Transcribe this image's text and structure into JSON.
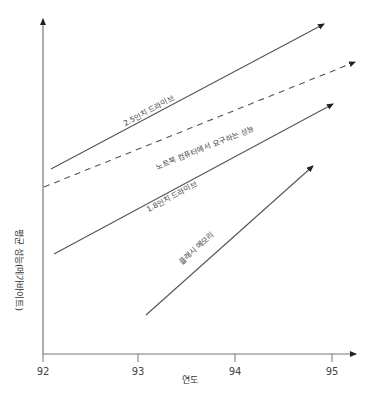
{
  "chart_data": {
    "type": "line",
    "title": "",
    "xlabel": "연도",
    "ylabel": "평균 성능(메가바이트)",
    "x_ticks": [
      "92",
      "93",
      "94",
      "95"
    ],
    "xlim": [
      92,
      95.25
    ],
    "y_ticks": [],
    "grid": false,
    "legend": "inline labels along lines",
    "series": [
      {
        "name": "2.5인치 드라이브",
        "style": "solid",
        "x": [
          92.08,
          95.0
        ],
        "y_rel": [
          0.53,
          0.95
        ]
      },
      {
        "name": "노트북 컴퓨터에서 요구하는 성능",
        "style": "dashed",
        "x": [
          92.0,
          95.25
        ],
        "y_rel": [
          0.49,
          0.87
        ]
      },
      {
        "name": "1.8인치 드라이브",
        "style": "solid",
        "x": [
          92.1,
          95.1
        ],
        "y_rel": [
          0.29,
          0.74
        ]
      },
      {
        "name": "플래시 메모리",
        "style": "solid",
        "x": [
          93.05,
          94.9
        ],
        "y_rel": [
          0.12,
          0.56
        ]
      }
    ]
  },
  "axes": {
    "x_label": "연도",
    "y_label": "평균 성능(메가바이트)",
    "ticks": [
      {
        "label": "92",
        "x": 43
      },
      {
        "label": "93",
        "x": 138
      },
      {
        "label": "94",
        "x": 235
      },
      {
        "label": "95",
        "x": 332
      }
    ]
  },
  "lines": [
    {
      "label": "2.5인치 드라이브",
      "x1": 51,
      "y1": 169,
      "x2": 324,
      "y2": 24,
      "dashed": false,
      "lx": 150,
      "ly": 113,
      "angle": -28
    },
    {
      "label": "노트북 컴퓨터에서 요구하는 성능",
      "x1": 44,
      "y1": 187,
      "x2": 355,
      "y2": 62,
      "dashed": true,
      "lx": 206,
      "ly": 150,
      "angle": -22
    },
    {
      "label": "1.8인치 드라이브",
      "x1": 54,
      "y1": 254,
      "x2": 333,
      "y2": 104,
      "dashed": false,
      "lx": 173,
      "ly": 199,
      "angle": -28
    },
    {
      "label": "플래시 메모리",
      "x1": 146,
      "y1": 315,
      "x2": 313,
      "y2": 166,
      "dashed": false,
      "lx": 198,
      "ly": 250,
      "angle": -42
    }
  ],
  "colors": {
    "axis": "#666666",
    "line": "#555555",
    "text": "#444444"
  }
}
